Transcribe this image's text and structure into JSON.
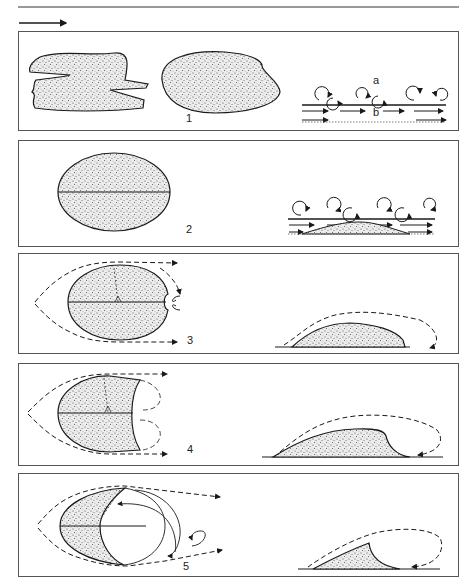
{
  "figure": {
    "flow_direction": "left-to-right",
    "panels": [
      {
        "id": 1,
        "label": "1",
        "annotations": [
          "a",
          "b"
        ]
      },
      {
        "id": 2,
        "label": "2"
      },
      {
        "id": 3,
        "label": "3"
      },
      {
        "id": 4,
        "label": "4"
      },
      {
        "id": 5,
        "label": "5"
      }
    ]
  },
  "colors": {
    "ink": "#1a1a1a",
    "border": "#555555",
    "sand": "#d8d8d8"
  }
}
